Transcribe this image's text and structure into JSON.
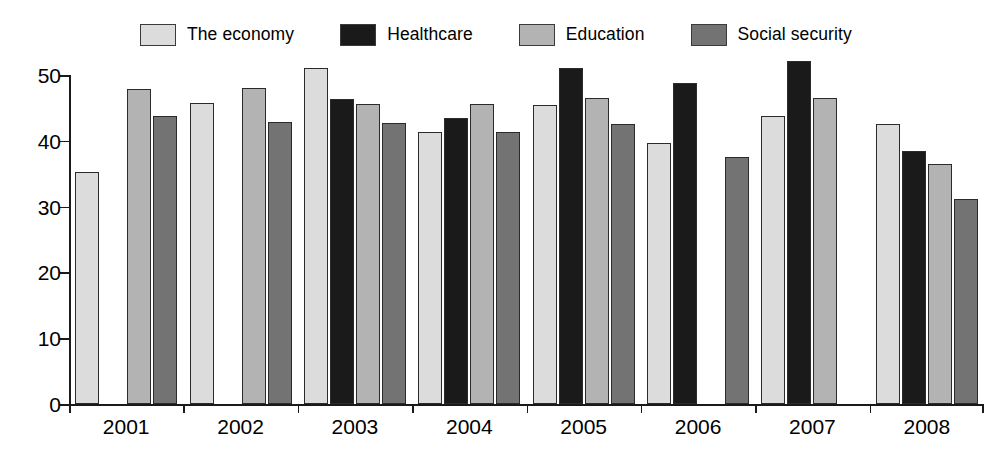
{
  "chart_data": {
    "type": "bar",
    "title": "",
    "subtitle": "",
    "xlabel": "",
    "ylabel": "",
    "ylim": [
      0,
      50
    ],
    "yticks": [
      0,
      10,
      20,
      30,
      40,
      50
    ],
    "ytick_labels": [
      "0",
      "10",
      "20",
      "30",
      "40",
      "50"
    ],
    "grid": false,
    "legend_position": "top",
    "categories": [
      "2001",
      "2002",
      "2003",
      "2004",
      "2005",
      "2006",
      "2007",
      "2008"
    ],
    "series": [
      {
        "name": "The economy",
        "color": "#dcdcdc",
        "values": [
          35.3,
          45.7,
          51.0,
          41.3,
          45.5,
          39.6,
          43.7,
          42.5
        ]
      },
      {
        "name": "Healthcare",
        "color": "#1a1a1a",
        "values": [
          null,
          null,
          46.4,
          43.4,
          51.0,
          48.8,
          52.2,
          38.5
        ]
      },
      {
        "name": "Education",
        "color": "#b3b3b3",
        "values": [
          47.9,
          48.0,
          45.6,
          45.6,
          46.5,
          null,
          46.5,
          36.5
        ]
      },
      {
        "name": "Social security",
        "color": "#737373",
        "values": [
          43.8,
          42.8,
          42.7,
          41.4,
          42.5,
          37.5,
          null,
          31.2
        ]
      }
    ]
  },
  "legend": {
    "items": [
      {
        "label": "The economy",
        "swatch_name": "legend-swatch-the-economy"
      },
      {
        "label": "Healthcare",
        "swatch_name": "legend-swatch-healthcare"
      },
      {
        "label": "Education",
        "swatch_name": "legend-swatch-education"
      },
      {
        "label": "Social security",
        "swatch_name": "legend-swatch-social-security"
      }
    ]
  }
}
